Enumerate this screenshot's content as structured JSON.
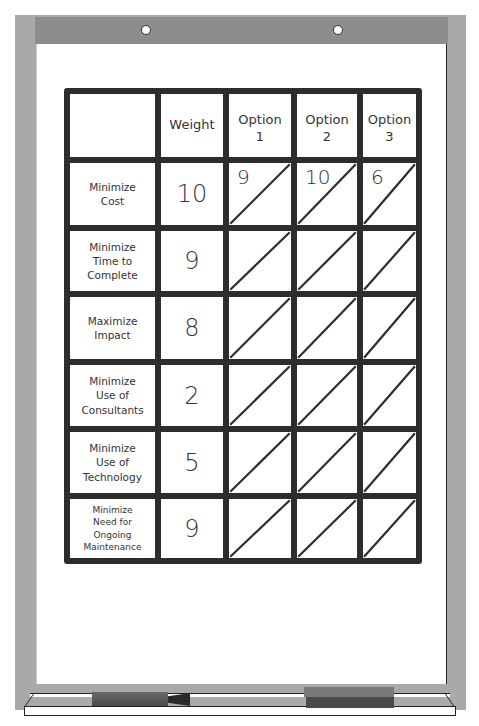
{
  "flipchart": {
    "header_holes": 2,
    "colors": {
      "frame": "#a9a9a9",
      "header_bar": "#8c8c8c",
      "grid_line": "#2d2d2d",
      "paper": "#ffffff"
    }
  },
  "table": {
    "columns": [
      "",
      "Weight",
      "Option\n1",
      "Option\n2",
      "Option\n3"
    ],
    "rows": [
      {
        "criterion": "Minimize\nCost",
        "weight": "10",
        "scores": [
          "9",
          "10",
          "6"
        ]
      },
      {
        "criterion": "Minimize\nTime to\nComplete",
        "weight": "9",
        "scores": [
          "",
          "",
          ""
        ]
      },
      {
        "criterion": "Maximize\nImpact",
        "weight": "8",
        "scores": [
          "",
          "",
          ""
        ]
      },
      {
        "criterion": "Minimize\nUse of\nConsultants",
        "weight": "2",
        "scores": [
          "",
          "",
          ""
        ]
      },
      {
        "criterion": "Minimize\nUse of\nTechnology",
        "weight": "5",
        "scores": [
          "",
          "",
          ""
        ]
      },
      {
        "criterion": "Minimize\nNeed for\nOngoing\nMaintenance",
        "weight": "9",
        "scores": [
          "",
          "",
          ""
        ]
      }
    ]
  },
  "tray": {
    "items": [
      "marker",
      "eraser"
    ]
  }
}
